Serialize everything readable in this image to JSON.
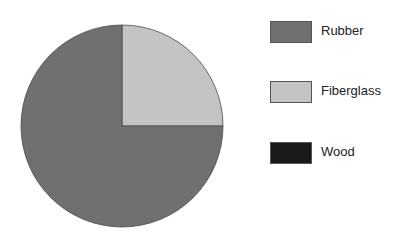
{
  "chart_data": {
    "type": "pie",
    "title": "",
    "categories": [
      "Rubber",
      "Fiberglass",
      "Wood"
    ],
    "values": [
      75,
      25,
      0
    ],
    "unit": "%",
    "colors": [
      "#707070",
      "#c4c4c4",
      "#1a1a1a"
    ],
    "start_angle_deg": 0,
    "direction": "clockwise",
    "legend_position": "right",
    "slice_order_note": "Fiberglass slice spans 12 o'clock to 3 o'clock; Rubber fills the rest; Wood not visible (0)"
  },
  "legend": {
    "items": [
      {
        "label": "Rubber",
        "color": "#707070"
      },
      {
        "label": "Fiberglass",
        "color": "#c4c4c4"
      },
      {
        "label": "Wood",
        "color": "#1a1a1a"
      }
    ]
  }
}
